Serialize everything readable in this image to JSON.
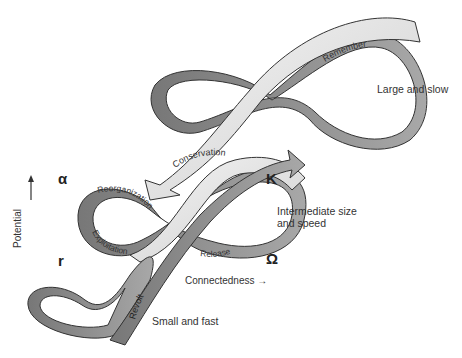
{
  "diagram": {
    "scales": [
      {
        "id": "large",
        "label": "Large and slow"
      },
      {
        "id": "intermediate",
        "label_line1": "Intermediate size",
        "label_line2": "and speed"
      },
      {
        "id": "small",
        "label": "Small and fast"
      }
    ],
    "phases": {
      "reorganization": "Reorganization",
      "conservation": "Conservation",
      "exploitation": "Exploitation",
      "release": "Release"
    },
    "links": {
      "remember": "Remember",
      "revolt": "Revolt"
    },
    "greek": {
      "alpha": "α",
      "kappa": "K",
      "r": "r",
      "omega": "Ω"
    },
    "axes": {
      "y": "Potential",
      "x": "Connectedness",
      "x_arrow": "→",
      "y_arrow": "↑"
    },
    "colors": {
      "ribbon_dark": "#8c8c8c",
      "ribbon_light": "#ececec",
      "outline": "#333333"
    }
  }
}
